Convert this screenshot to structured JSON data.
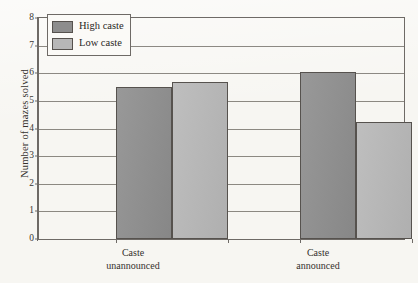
{
  "chart_data": {
    "type": "bar",
    "title": "",
    "subtitle": "",
    "xlabel": "",
    "ylabel": "Number of mazes solved",
    "categories": [
      "Caste unannounced",
      "Caste announced"
    ],
    "category_lines": [
      {
        "line1": "Caste",
        "line2": "unannounced"
      },
      {
        "line1": "Caste",
        "line2": "announced"
      }
    ],
    "series": [
      {
        "name": "High caste",
        "color": "#8d8d8d",
        "values": [
          5.5,
          6.05
        ]
      },
      {
        "name": "Low caste",
        "color": "#b7b7b7",
        "values": [
          5.7,
          4.25
        ]
      }
    ],
    "ylim": [
      0,
      8
    ],
    "yticks": [
      0,
      1,
      2,
      3,
      4,
      5,
      6,
      7,
      8
    ],
    "ytick_labels": [
      "0",
      "1",
      "2",
      "3",
      "4",
      "5",
      "6",
      "7",
      "8"
    ],
    "grid": true,
    "grid_axis": "y",
    "legend_position": "upper left",
    "legend_entries": [
      "High caste",
      "Low caste"
    ],
    "frame": true,
    "bar_edge_color": "#56524e",
    "axis_color": "#6e6a66",
    "background_color": "#f7f6f2"
  }
}
